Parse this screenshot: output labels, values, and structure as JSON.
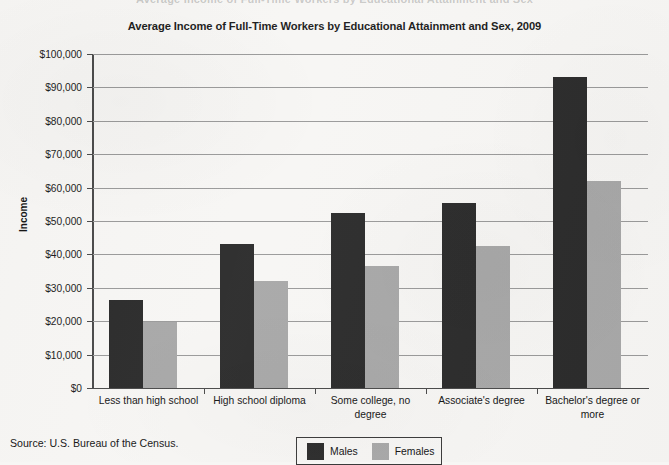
{
  "page": {
    "bleed_top_text": "Average Income of Full-Time Workers by Educational Attainment and Sex"
  },
  "source": {
    "text": "Source: U.S. Bureau of the Census."
  },
  "legend": {
    "items": [
      {
        "label": "Males",
        "color": "#2b2b2b"
      },
      {
        "label": "Females",
        "color": "#a8a8a8"
      }
    ]
  },
  "chart_data": {
    "type": "bar",
    "title": "Average Income of Full-Time Workers by Educational Attainment and Sex, 2009",
    "xlabel": "",
    "ylabel": "Income",
    "ylim": [
      0,
      100000
    ],
    "ytick_labels": [
      "$100,000",
      "$90,000",
      "$80,000",
      "$70,000",
      "$60,000",
      "$50,000",
      "$40,000",
      "$30,000",
      "$20,000",
      "$10,000",
      "$0"
    ],
    "ytick_values": [
      100000,
      90000,
      80000,
      70000,
      60000,
      50000,
      40000,
      30000,
      20000,
      10000,
      0
    ],
    "grid": true,
    "legend_position": "bottom-center",
    "categories": [
      "Less than high school",
      "High school diploma",
      "Some college, no degree",
      "Associate's degree",
      "Bachelor's degree or more"
    ],
    "series": [
      {
        "name": "Males",
        "color": "#2b2b2b",
        "values": [
          26300,
          43000,
          52500,
          55500,
          93000
        ]
      },
      {
        "name": "Females",
        "color": "#a8a8a8",
        "values": [
          19700,
          32000,
          36500,
          42500,
          62000
        ]
      }
    ]
  }
}
